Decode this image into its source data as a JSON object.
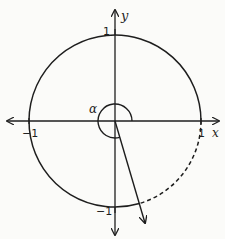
{
  "diagram": {
    "type": "unit-circle",
    "colors": {
      "stroke": "#1e1e1e",
      "background": "#fbfbf9"
    },
    "axes": {
      "x_label": "x",
      "y_label": "y"
    },
    "ticks": {
      "top": "1",
      "left": "−1",
      "right": "1",
      "bottom": "−1"
    },
    "angle": {
      "label": "α",
      "degrees_approx": 286
    },
    "arcs": {
      "solid": "counterclockwise from angle terminal side back to positive x-axis",
      "dashed": "from positive x-axis clockwise to terminal side"
    }
  }
}
